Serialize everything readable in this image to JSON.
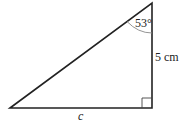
{
  "diagram": {
    "type": "right-triangle",
    "vertices": {
      "bottom_left": [
        10,
        108
      ],
      "top_right": [
        152,
        3
      ],
      "bottom_right": [
        152,
        108
      ]
    },
    "labels": {
      "angle": "53°",
      "vertical_side": "5 cm",
      "horizontal_side": "c"
    },
    "right_angle_marker": true,
    "colors": {
      "line": "#222222",
      "arc": "#888888",
      "background": "#ffffff"
    }
  }
}
